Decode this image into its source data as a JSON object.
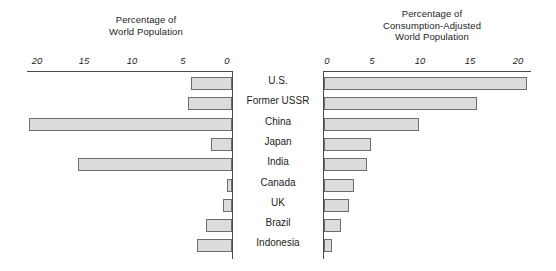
{
  "chart_data": {
    "type": "bar",
    "layout": "bidirectional-population-pyramid",
    "title": "",
    "categories": [
      "U.S.",
      "Former USSR",
      "China",
      "Japan",
      "India",
      "Canada",
      "UK",
      "Brazil",
      "Indonesia"
    ],
    "panels": [
      {
        "id": "left",
        "title_lines": [
          "Percentage of",
          "World Population"
        ],
        "xlabel": "",
        "ylabel": "",
        "direction": "left",
        "ticks": [
          20,
          15,
          10,
          5,
          0
        ],
        "tick_labels": [
          "20",
          "15",
          "10",
          "5",
          "0"
        ],
        "xlim": [
          0,
          21.5
        ],
        "values": [
          4.3,
          4.7,
          21.5,
          2.2,
          16.3,
          0.5,
          1.0,
          2.8,
          3.7
        ]
      },
      {
        "id": "right",
        "title_lines": [
          "Percentage of",
          "Consumption-Adjusted",
          "World Population"
        ],
        "xlabel": "",
        "ylabel": "",
        "direction": "right",
        "ticks": [
          0,
          5,
          10,
          15,
          20
        ],
        "tick_labels": [
          "0",
          "5",
          "10",
          "15",
          "20"
        ],
        "xlim": [
          0,
          21.5
        ],
        "values": [
          21.5,
          16.2,
          10.0,
          5.0,
          4.5,
          3.2,
          2.6,
          1.8,
          0.8
        ]
      }
    ],
    "grid": false,
    "legend": null,
    "colors": {
      "bar_fill": "#dcdcdc",
      "bar_stroke": "#6d6d6d",
      "axis": "#4a4a4a",
      "text": "#1d1d1d",
      "background": "#ffffff"
    }
  }
}
